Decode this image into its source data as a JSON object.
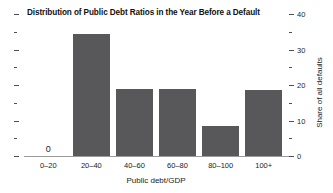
{
  "chart_data": {
    "type": "bar",
    "title": "Distribution of Public Debt Ratios in the Year Before a Default",
    "xlabel": "Public debt/GDP",
    "ylabel": "Share of all defaults",
    "categories": [
      "0–20",
      "20–40",
      "40–60",
      "60–80",
      "80–100",
      "100+"
    ],
    "values": [
      0,
      34.5,
      19,
      19,
      8.5,
      18.5
    ],
    "value_labels": [
      "0",
      "",
      "",
      "",
      "",
      ""
    ],
    "ylim": [
      0,
      40
    ],
    "y_axis_position": "right",
    "y_ticks_major": [
      0,
      10,
      20,
      30,
      40
    ],
    "y_ticks_minor": [
      5,
      15,
      25,
      35
    ],
    "y_tick_labels": [
      "0",
      "10",
      "20",
      "30",
      "40"
    ],
    "grid": false,
    "legend": false,
    "bar_color": "#58585a",
    "background_color": "#ffffff",
    "axis_color": "#4d4d4d"
  }
}
